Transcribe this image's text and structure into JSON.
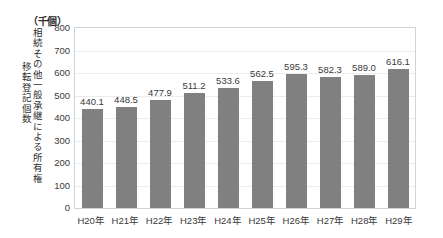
{
  "chart_data": {
    "type": "bar",
    "title": "",
    "subtitle": "",
    "unit_label": "（千個）",
    "xlabel": "",
    "ylabel_outer": "移転登記個数",
    "ylabel_inner": "相続その他一般承継による所有権",
    "categories": [
      "H20年",
      "H21年",
      "H22年",
      "H23年",
      "H24年",
      "H25年",
      "H26年",
      "H27年",
      "H28年",
      "H29年"
    ],
    "values": [
      440.1,
      448.5,
      477.9,
      511.2,
      533.6,
      562.5,
      595.3,
      582.3,
      589.0,
      616.1
    ],
    "data_labels": [
      "440.1",
      "448.5",
      "477.9",
      "511.2",
      "533.6",
      "562.5",
      "595.3",
      "582.3",
      "589.0",
      "616.1"
    ],
    "ylim": [
      0,
      800
    ],
    "ytick_values": [
      800,
      700,
      600,
      500,
      400,
      300,
      200,
      100,
      0
    ],
    "ytick_labels": [
      "800",
      "700",
      "600",
      "500",
      "400",
      "300",
      "200",
      "100",
      "0"
    ],
    "grid": true,
    "legend": false,
    "legend_position": "none",
    "bar_color": "#808080",
    "plot_border_color": "#d3d3d3",
    "gridline_color": "#ececec",
    "background_color": "#ffffff",
    "text_color": "#3a3a3a"
  }
}
